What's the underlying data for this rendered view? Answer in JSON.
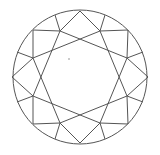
{
  "diagram": {
    "stroke_color": "#555555",
    "background": "#ffffff",
    "girdle": {
      "cx": 80,
      "cy": 77,
      "r": 67
    },
    "star_square_a": "60,31 127,58 100,123 33,96",
    "star_square_b": "100,31 127,96 60,123 33,58",
    "segments": [
      [
        33,
        30,
        60,
        31
      ],
      [
        33,
        30,
        33,
        58
      ],
      [
        128,
        30,
        100,
        31
      ],
      [
        128,
        30,
        127,
        58
      ],
      [
        128,
        124,
        127,
        96
      ],
      [
        128,
        124,
        100,
        123
      ],
      [
        33,
        124,
        60,
        123
      ],
      [
        33,
        124,
        33,
        96
      ],
      [
        80,
        11,
        60,
        31
      ],
      [
        80,
        11,
        100,
        31
      ],
      [
        80,
        143,
        60,
        123
      ],
      [
        80,
        143,
        100,
        123
      ],
      [
        12,
        77,
        33,
        58
      ],
      [
        12,
        77,
        33,
        96
      ],
      [
        148,
        77,
        127,
        58
      ],
      [
        148,
        77,
        127,
        96
      ],
      [
        60,
        31,
        55,
        15
      ],
      [
        100,
        31,
        105,
        15
      ],
      [
        127,
        58,
        143,
        52
      ],
      [
        127,
        96,
        143,
        102
      ],
      [
        100,
        123,
        105,
        139
      ],
      [
        60,
        123,
        55,
        139
      ],
      [
        33,
        96,
        17,
        102
      ],
      [
        33,
        58,
        17,
        52
      ]
    ],
    "marks": [
      {
        "x": 69,
        "y": 59,
        "r": 0.8
      }
    ]
  }
}
